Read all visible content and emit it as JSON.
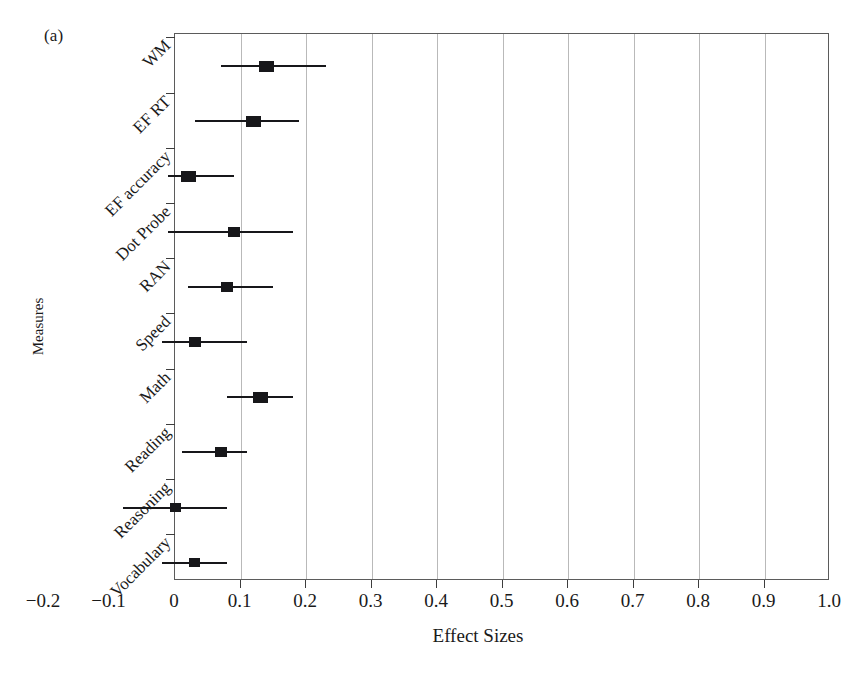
{
  "figure": {
    "panel_label": "(a)",
    "y_axis_title": "Measures",
    "x_axis_title": "Effect Sizes"
  },
  "chart_data": {
    "type": "bar",
    "subtype": "forest-plot",
    "title": "(a)",
    "xlabel": "Effect Sizes",
    "ylabel": "Measures",
    "xlim": [
      -0.2,
      1.0
    ],
    "plot_xlim": [
      0.0,
      1.0
    ],
    "grid": true,
    "legend": null,
    "xticks": [
      -0.2,
      -0.1,
      0,
      0.1,
      0.2,
      0.3,
      0.4,
      0.5,
      0.6,
      0.7,
      0.8,
      0.9,
      1.0
    ],
    "xtick_labels": [
      "-0.2",
      "-0.1",
      "0",
      "0.1",
      "0.2",
      "0.3",
      "0.4",
      "0.5",
      "0.6",
      "0.7",
      "0.8",
      "0.9",
      "1.0"
    ],
    "categories": [
      "WM",
      "EF RT",
      "EF accuracy",
      "Dot Probe",
      "RAN",
      "Speed",
      "Math",
      "Reading",
      "Reasoning",
      "Vocabulary"
    ],
    "values": [
      0.14,
      0.12,
      0.02,
      0.09,
      0.08,
      0.03,
      0.13,
      0.07,
      0.0,
      0.03
    ],
    "ci_low": [
      0.07,
      0.03,
      -0.01,
      -0.01,
      0.02,
      -0.02,
      0.08,
      0.01,
      -0.08,
      -0.02
    ],
    "ci_high": [
      0.23,
      0.19,
      0.09,
      0.18,
      0.15,
      0.11,
      0.18,
      0.11,
      0.08,
      0.08
    ],
    "points": [
      {
        "measure": "WM",
        "effect_size": 0.14,
        "ci_low": 0.07,
        "ci_high": 0.23,
        "marker_size": "large"
      },
      {
        "measure": "EF RT",
        "effect_size": 0.12,
        "ci_low": 0.03,
        "ci_high": 0.19,
        "marker_size": "large"
      },
      {
        "measure": "EF accuracy",
        "effect_size": 0.02,
        "ci_low": -0.01,
        "ci_high": 0.09,
        "marker_size": "large"
      },
      {
        "measure": "Dot Probe",
        "effect_size": 0.09,
        "ci_low": -0.01,
        "ci_high": 0.18,
        "marker_size": "small"
      },
      {
        "measure": "RAN",
        "effect_size": 0.08,
        "ci_low": 0.02,
        "ci_high": 0.15,
        "marker_size": "small"
      },
      {
        "measure": "Speed",
        "effect_size": 0.03,
        "ci_low": -0.02,
        "ci_high": 0.11,
        "marker_size": "small"
      },
      {
        "measure": "Math",
        "effect_size": 0.13,
        "ci_low": 0.08,
        "ci_high": 0.18,
        "marker_size": "large"
      },
      {
        "measure": "Reading",
        "effect_size": 0.07,
        "ci_low": 0.01,
        "ci_high": 0.11,
        "marker_size": "small"
      },
      {
        "measure": "Reasoning",
        "effect_size": 0.0,
        "ci_low": -0.08,
        "ci_high": 0.08,
        "marker_size": "tiny"
      },
      {
        "measure": "Vocabulary",
        "effect_size": 0.03,
        "ci_low": -0.02,
        "ci_high": 0.08,
        "marker_size": "tiny"
      }
    ],
    "colors": {
      "marker": "#17171a",
      "ci_line": "#17171a",
      "gridline": "#b9b9b9",
      "axis": "#5b5b5b",
      "background": "#ffffff"
    }
  }
}
